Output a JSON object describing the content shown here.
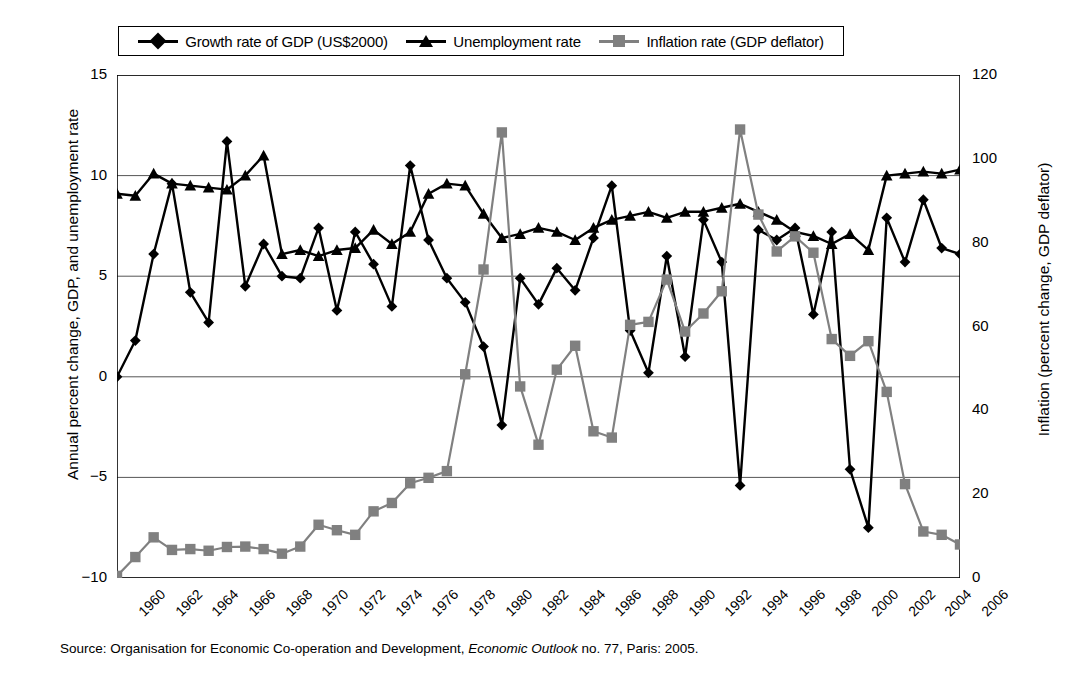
{
  "legend": {
    "items": [
      {
        "label": "Growth rate of GDP (US$2000)",
        "marker": "diamond",
        "color": "#000000",
        "icon": "legend-diamond-icon"
      },
      {
        "label": "Unemployment rate",
        "marker": "triangle",
        "color": "#000000",
        "icon": "legend-triangle-icon"
      },
      {
        "label": "Inflation rate (GDP deflator)",
        "marker": "square",
        "color": "#808080",
        "icon": "legend-square-icon"
      }
    ]
  },
  "axes": {
    "left_title": "Annual percent change, GDP, and unemployment rate",
    "right_title": "Inflation (percent change, GDP deflator)",
    "left_ticks": [
      "15",
      "10",
      "5",
      "0",
      "-5",
      "-10"
    ],
    "right_ticks": [
      "120",
      "100",
      "80",
      "60",
      "40",
      "20",
      "0"
    ]
  },
  "source": {
    "prefix": "Source: Organisation for Economic Co-operation and Development, ",
    "italic": "Economic Outlook",
    "suffix": " no. 77, Paris: 2005."
  },
  "chart_data": {
    "type": "line",
    "title": "",
    "xlabel": "",
    "ylabel": "Annual percent change, GDP, and unemployment rate",
    "y2label": "Inflation (percent change, GDP deflator)",
    "ylim": [
      -10,
      15
    ],
    "y2lim": [
      0,
      120
    ],
    "grid": true,
    "legend_position": "top",
    "x": [
      1960,
      1961,
      1962,
      1963,
      1964,
      1965,
      1966,
      1967,
      1968,
      1969,
      1970,
      1971,
      1972,
      1973,
      1974,
      1975,
      1976,
      1977,
      1978,
      1979,
      1980,
      1981,
      1982,
      1983,
      1984,
      1985,
      1986,
      1987,
      1988,
      1989,
      1990,
      1991,
      1992,
      1993,
      1994,
      1995,
      1996,
      1997,
      1998,
      1999,
      2000,
      2001,
      2002,
      2003,
      2004,
      2005,
      2006
    ],
    "tick_labels": [
      "1960",
      "1962",
      "1964",
      "1966",
      "1968",
      "1970",
      "1972",
      "1974",
      "1976",
      "1978",
      "1980",
      "1982",
      "1984",
      "1986",
      "1988",
      "1990",
      "1992",
      "1994",
      "1996",
      "1998",
      "2000",
      "2002",
      "2004",
      "2006"
    ],
    "tick_step_years": 2,
    "series": [
      {
        "name": "Growth rate of GDP (US$2000)",
        "axis": "left",
        "color": "#000000",
        "marker": "diamond",
        "values": [
          0.0,
          1.8,
          6.1,
          9.6,
          4.2,
          2.7,
          11.7,
          4.5,
          6.6,
          5.0,
          4.9,
          7.4,
          3.3,
          7.2,
          5.6,
          3.5,
          10.5,
          6.8,
          4.9,
          3.7,
          1.5,
          -2.4,
          4.9,
          3.6,
          5.4,
          4.3,
          6.9,
          9.5,
          2.3,
          0.2,
          6.0,
          1.0,
          7.8,
          5.7,
          -5.4,
          7.3,
          6.8,
          7.4,
          3.1,
          7.2,
          -4.6,
          -7.5,
          7.9,
          5.7,
          8.8,
          6.4,
          6.1
        ]
      },
      {
        "name": "Unemployment rate",
        "axis": "left",
        "color": "#000000",
        "marker": "triangle",
        "values": [
          9.1,
          9.0,
          10.1,
          9.6,
          9.5,
          9.4,
          9.3,
          10.0,
          11.0,
          6.1,
          6.3,
          6.0,
          6.3,
          6.4,
          7.3,
          6.6,
          7.2,
          9.1,
          9.6,
          9.5,
          8.1,
          6.9,
          7.1,
          7.4,
          7.2,
          6.8,
          7.4,
          7.8,
          8.0,
          8.2,
          7.9,
          8.2,
          8.2,
          8.4,
          8.6,
          8.2,
          7.8,
          7.2,
          7.0,
          6.6,
          7.1,
          6.3,
          10.0,
          10.1,
          10.2,
          10.1,
          10.3
        ]
      },
      {
        "name": "Inflation rate (GDP deflator)",
        "axis": "right",
        "color": "#808080",
        "marker": "square",
        "values": [
          0.5,
          5.0,
          9.7,
          6.7,
          6.9,
          6.5,
          7.4,
          7.5,
          6.9,
          5.8,
          7.5,
          12.7,
          11.4,
          10.3,
          15.9,
          17.9,
          22.6,
          23.9,
          25.5,
          48.6,
          73.6,
          106.3,
          45.7,
          31.8,
          49.7,
          55.4,
          35.0,
          33.5,
          60.4,
          61.1,
          71.2,
          58.8,
          63.1,
          68.4,
          107.0,
          86.7,
          77.9,
          81.5,
          77.6,
          57.0,
          53.0,
          56.5,
          44.4,
          22.4,
          11.1,
          10.3,
          8.0
        ]
      }
    ]
  }
}
